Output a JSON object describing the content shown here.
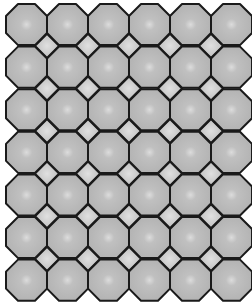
{
  "figure": {
    "columns": 6,
    "rows": 7,
    "origin_x": 6,
    "origin_y": 4,
    "pitch_x": 41,
    "pitch_y": 42.6,
    "octagon_size": 41,
    "colors": {
      "octagon_fill": "#b5b5b5",
      "octagon_highlight": "#d8d8d8",
      "square_fill": "#c4c4c4",
      "square_highlight": "#dedede",
      "stroke": "#1a1a1a",
      "background": "#ffffff"
    }
  }
}
